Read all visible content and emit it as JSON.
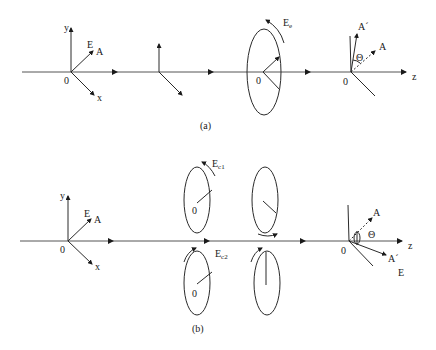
{
  "panels": [
    {
      "id": "a",
      "caption": "(a)",
      "source": {
        "origin_label": "0",
        "y_label": "y",
        "x_label": "x",
        "field_label": "E",
        "polarizer_label": "A"
      },
      "circular": {
        "origin_label": "0",
        "field_label": "E",
        "field_sub": "e"
      },
      "analyzer": {
        "origin_label": "0",
        "rotated_label": "A´",
        "original_label": "A",
        "angle_label": "Θ",
        "axis_label": "z"
      }
    },
    {
      "id": "b",
      "caption": "(b)",
      "source": {
        "origin_label": "0",
        "y_label": "y",
        "x_label": "x",
        "field_label": "E",
        "polarizer_label": "A"
      },
      "circular_top": {
        "origin_label": "0",
        "field_label": "E",
        "field_sub": "c1"
      },
      "circular_bottom": {
        "origin_label": "0",
        "field_label": "E",
        "field_sub": "c2"
      },
      "analyzer": {
        "original_label": "A",
        "rotated_label": "A´",
        "angle_label": "Θ",
        "phi_label": "φ",
        "field_label": "E",
        "origin_label": "0",
        "axis_label": "z"
      }
    }
  ]
}
